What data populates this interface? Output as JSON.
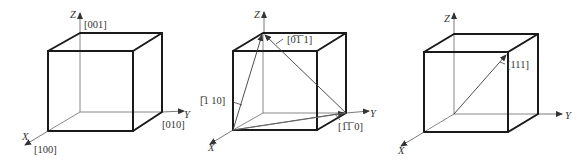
{
  "figures": [
    {
      "id": "cube-axes",
      "axes": {
        "x": "X",
        "y": "Y",
        "z": "Z"
      },
      "labels": {
        "z_dir": "[001]",
        "y_dir": "[010]",
        "x_dir": "[100]"
      }
    },
    {
      "id": "cube-face-diagonals",
      "axes": {
        "x": "X",
        "y": "Y",
        "z": "Z"
      },
      "labels": {
        "d1": "[0̅1̅ 1]",
        "d2": "[̅1 10]",
        "d3": "[1̅1̅ 0]"
      },
      "labels_plain": {
        "d1": "[0-11]",
        "d2": "[-110]",
        "d3": "[1-10]"
      }
    },
    {
      "id": "cube-body-diagonal",
      "axes": {
        "x": "X",
        "y": "Y",
        "z": "Z"
      },
      "labels": {
        "d1": "[111]"
      }
    }
  ]
}
